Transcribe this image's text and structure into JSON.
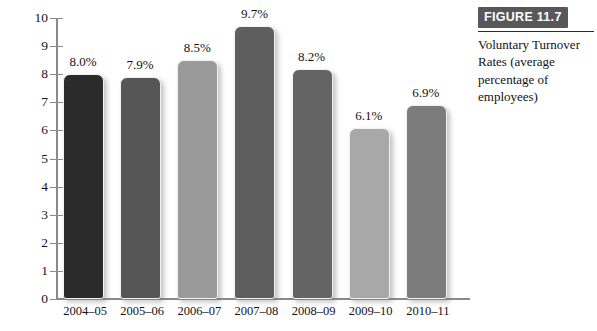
{
  "figure": {
    "banner_label": "FIGURE 11.7",
    "caption": "Voluntary Turnover Rates (average percentage of employees)"
  },
  "chart_data": {
    "type": "bar",
    "title": "Voluntary Turnover Rates (average percentage of employees)",
    "xlabel": "",
    "ylabel": "",
    "ylim": [
      0,
      10
    ],
    "ytick_step": 1,
    "grid": false,
    "legend": "none",
    "categories": [
      "2004–05",
      "2005–06",
      "2006–07",
      "2007–08",
      "2008–09",
      "2009–10",
      "2010–11"
    ],
    "values": [
      8.0,
      7.9,
      8.5,
      9.7,
      8.2,
      6.1,
      6.9
    ],
    "value_labels": [
      "8.0%",
      "7.9%",
      "8.5%",
      "9.7%",
      "8.2%",
      "6.1%",
      "6.9%"
    ],
    "ytick_labels": [
      "10",
      "9",
      "8",
      "7",
      "6",
      "5",
      "4",
      "3",
      "2",
      "1",
      "0"
    ],
    "bar_colors": [
      "#2b2b2b",
      "#565656",
      "#9a9a9a",
      "#5e5e5e",
      "#646464",
      "#a8a8a8",
      "#7c7c7c"
    ]
  },
  "colors": {
    "axis": "#8a8a8a",
    "banner_bg": "#58585a",
    "banner_text": "#ffffff",
    "text": "#121212",
    "background": "#ffffff"
  }
}
